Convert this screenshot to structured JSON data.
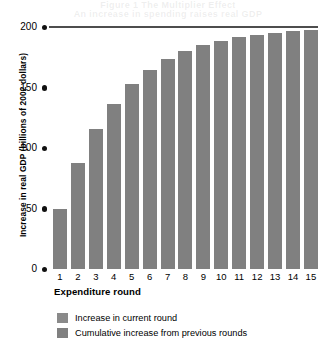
{
  "ghost_text": {
    "line1": "Figure 1 The Multiplier Effect",
    "line2": "An increase in spending raises real GDP"
  },
  "chart_data": {
    "type": "bar",
    "title": "",
    "xlabel": "Expenditure round",
    "ylabel": "Increase in real GDP (billions of 2002 dollars)",
    "categories": [
      "1",
      "2",
      "3",
      "4",
      "5",
      "6",
      "7",
      "8",
      "9",
      "10",
      "11",
      "12",
      "13",
      "14",
      "15"
    ],
    "values": [
      50.0,
      87.5,
      115.6,
      136.7,
      152.6,
      164.4,
      173.3,
      180.0,
      185.0,
      188.7,
      191.6,
      193.7,
      195.2,
      196.4,
      197.3
    ],
    "ylim": [
      0,
      200
    ],
    "yticks": [
      0,
      50,
      100,
      150,
      200
    ],
    "ytick_labels": [
      "0",
      "50",
      "100",
      "150",
      "200"
    ],
    "grid": false,
    "limit_line_value": 200,
    "bar_color": "#808080",
    "legend_position": "below",
    "legend": [
      {
        "label": "Increase in current round",
        "color": "#8a8a8a"
      },
      {
        "label": "Cumulative increase from previous rounds",
        "color": "#808080"
      }
    ]
  }
}
